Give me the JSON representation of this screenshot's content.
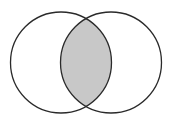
{
  "diagram": {
    "type": "venn",
    "sets": [
      {
        "name": "left-set",
        "cx": 61,
        "cy": 62.5,
        "r": 50.5
      },
      {
        "name": "right-set",
        "cx": 111,
        "cy": 62.5,
        "r": 50.5
      }
    ],
    "shaded_region": "intersection",
    "colors": {
      "background": "#ffffff",
      "stroke": "#2a2a2a",
      "intersection_fill": "#c8c8c8"
    }
  }
}
